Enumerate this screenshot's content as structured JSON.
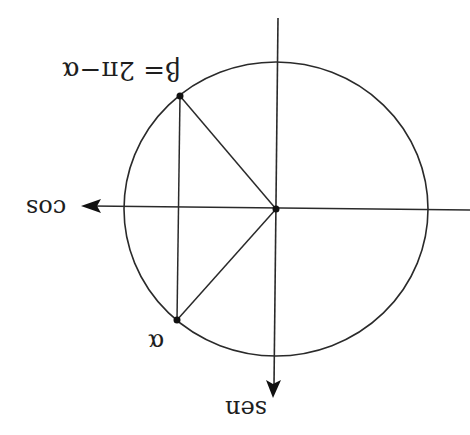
{
  "diagram": {
    "orientation": "rotated 180 degrees",
    "axes": {
      "horizontal_label": "cos",
      "vertical_label": "sen"
    },
    "points": {
      "alpha_label": "α",
      "beta_label": "β= 2π−α"
    },
    "colors": {
      "stroke": "#222222",
      "background": "#ffffff"
    }
  }
}
